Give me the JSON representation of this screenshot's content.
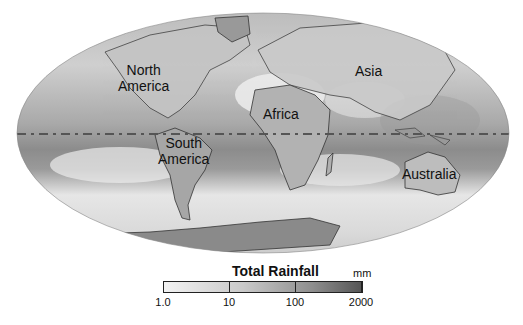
{
  "map": {
    "projection": "Mollweide (elliptical world map)",
    "style": "grayscale shaded rainfall with continent outlines",
    "equator_line": "dashed",
    "colors": {
      "background": "#ffffff",
      "ocean_light": "#e6e6e6",
      "ocean_mid": "#bdbdbd",
      "wet_band": "#8f8f8f",
      "outline": "#333333",
      "antarctica": "#8a8a8a"
    }
  },
  "labels": {
    "north_america": "North\nAmerica",
    "north_america_line1": "North",
    "north_america_line2": "America",
    "south_america_line1": "South",
    "south_america_line2": "America",
    "africa": "Africa",
    "asia": "Asia",
    "australia": "Australia"
  },
  "legend": {
    "title": "Total Rainfall",
    "unit": "mm",
    "ticks": [
      "1.0",
      "10",
      "100",
      "2000"
    ],
    "gradient": [
      "#f2f2f2",
      "#555555"
    ]
  }
}
